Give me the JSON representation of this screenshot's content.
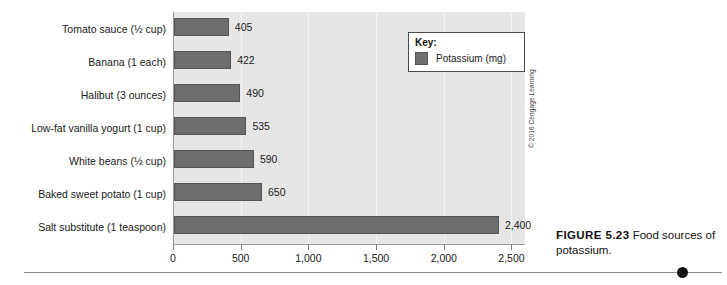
{
  "chart_data": {
    "type": "bar",
    "orientation": "horizontal",
    "title": "",
    "xlabel": "",
    "ylabel": "",
    "xlim": [
      0,
      2600
    ],
    "xticks": [
      0,
      500,
      1000,
      1500,
      2000,
      2500
    ],
    "xtick_labels": [
      "0",
      "500",
      "1,000",
      "1,500",
      "2,000",
      "2,500"
    ],
    "grid": true,
    "legend_position": "top-right",
    "categories": [
      "Tomato sauce (½ cup)",
      "Banana (1 each)",
      "Halibut (3 ounces)",
      "Low-fat vanilla yogurt (1 cup)",
      "White beans (½ cup)",
      "Baked sweet potato (1 cup)",
      "Salt substitute (1 teaspoon)"
    ],
    "values": [
      405,
      422,
      490,
      535,
      590,
      650,
      2400
    ],
    "value_labels": [
      "405",
      "422",
      "490",
      "535",
      "590",
      "650",
      "2,400"
    ],
    "series": [
      {
        "name": "Potassium (mg)",
        "values": [
          405,
          422,
          490,
          535,
          590,
          650,
          2400
        ],
        "color": "#6e6e6e"
      }
    ]
  },
  "legend": {
    "title": "Key:",
    "entries": [
      {
        "label": "Potassium (mg)",
        "color": "#6e6e6e"
      }
    ]
  },
  "caption": {
    "number": "FIGURE 5.23",
    "text": " Food sources of potassium."
  },
  "copyright": "© 2016 Cengage Learning",
  "colors": {
    "bar": "#6e6e6e",
    "bar_border": "#545454",
    "plot_background": "#e6e6e6",
    "gridline": "#f4f4f4",
    "axis": "#9a9a9a",
    "text": "#1a1a1a",
    "page_background": "#ffffff"
  }
}
